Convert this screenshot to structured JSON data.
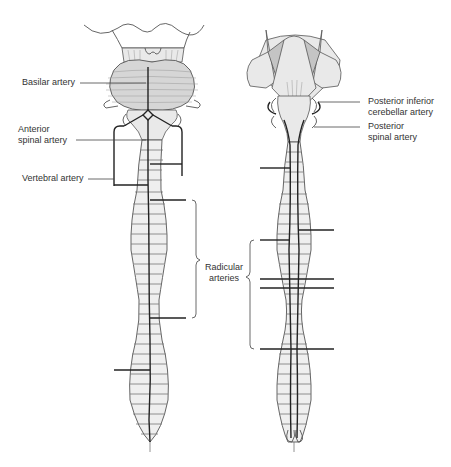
{
  "figure": {
    "type": "anatomical-diagram",
    "panels": [
      {
        "id": "anterior-view",
        "labels": {
          "basilar": "Basilar artery",
          "anterior_spinal_1": "Anterior",
          "anterior_spinal_2": "spinal artery",
          "vertebral": "Vertebral artery"
        }
      },
      {
        "id": "posterior-view",
        "labels": {
          "pica_1": "Posterior inferior",
          "pica_2": "cerebellar artery",
          "posterior_spinal_1": "Posterior",
          "posterior_spinal_2": "spinal artery"
        }
      }
    ],
    "shared_labels": {
      "radicular_1": "Radicular",
      "radicular_2": "arteries"
    },
    "colors": {
      "background": "#ffffff",
      "outline": "#555555",
      "artery": "#222222",
      "cord_fill": "#efefef",
      "pons_fill": "#d6d6d6",
      "text": "#333333"
    }
  }
}
